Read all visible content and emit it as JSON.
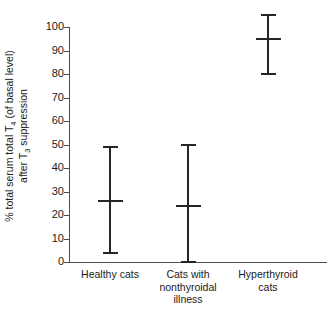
{
  "chart_data": {
    "type": "errorbar",
    "title": "",
    "xlabel": "",
    "ylabel_line1": "% total serum total T",
    "ylabel_line1_sub": "4",
    "ylabel_line1_tail": " (of basal level)",
    "ylabel_line2": "after T",
    "ylabel_line2_sub": "3",
    "ylabel_line2_tail": " suppression",
    "ylim": [
      0,
      100
    ],
    "ytick_step": 10,
    "yticks": [
      "100",
      "90",
      "80",
      "70",
      "60",
      "50",
      "40",
      "30",
      "20",
      "10",
      "0"
    ],
    "grid": false,
    "legend": "none",
    "categories": [
      "Healthy cats",
      "Cats with nonthyroidal illness",
      "Hyperthyroid cats"
    ],
    "category_label_lines": [
      [
        "Healthy cats"
      ],
      [
        "Cats with",
        "nonthyroidal",
        "illness"
      ],
      [
        "Hyperthyroid",
        "cats"
      ]
    ],
    "series": [
      {
        "name": "% total serum total T4 after T3 suppression",
        "marker": "mean with range bars",
        "points": [
          {
            "category": "Healthy cats",
            "mean": 26,
            "low": 4,
            "high": 49
          },
          {
            "category": "Cats with nonthyroidal illness",
            "mean": 24,
            "low": 0,
            "high": 50
          },
          {
            "category": "Hyperthyroid cats",
            "mean": 95,
            "low": 80,
            "high": 105
          }
        ]
      }
    ],
    "colors": {
      "marker": "#262626",
      "axis": "#4d4d4d",
      "text": "#1a1a1a",
      "background": "#ffffff"
    }
  }
}
